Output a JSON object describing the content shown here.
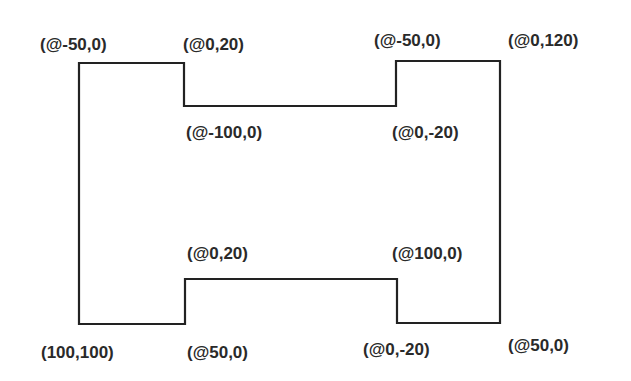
{
  "diagram": {
    "stroke_color": "#222222",
    "outline_points": [
      [
        79,
        63
      ],
      [
        184,
        63
      ],
      [
        184,
        106
      ],
      [
        396,
        106
      ],
      [
        396,
        61
      ],
      [
        500,
        61
      ],
      [
        500,
        323
      ],
      [
        397,
        323
      ],
      [
        397,
        279
      ],
      [
        185,
        279
      ],
      [
        185,
        324
      ],
      [
        79,
        324
      ]
    ],
    "labels": [
      {
        "id": "top-left-corner",
        "text": "(@-50,0)",
        "x": 40,
        "y": 36
      },
      {
        "id": "top-left-step",
        "text": "(@0,20)",
        "x": 183,
        "y": 36
      },
      {
        "id": "top-inner-left",
        "text": "(@-100,0)",
        "x": 186,
        "y": 124
      },
      {
        "id": "top-right-step",
        "text": "(@-50,0)",
        "x": 374,
        "y": 32
      },
      {
        "id": "top-right-corner",
        "text": "(@0,120)",
        "x": 508,
        "y": 32
      },
      {
        "id": "top-inner-right",
        "text": "(@0,-20)",
        "x": 392,
        "y": 124
      },
      {
        "id": "bottom-inner-left",
        "text": "(@0,20)",
        "x": 187,
        "y": 245
      },
      {
        "id": "bottom-inner-right",
        "text": "(@100,0)",
        "x": 392,
        "y": 245
      },
      {
        "id": "start-point",
        "text": "(100,100)",
        "x": 41,
        "y": 344
      },
      {
        "id": "bottom-left-step",
        "text": "(@50,0)",
        "x": 187,
        "y": 344
      },
      {
        "id": "bottom-right-step",
        "text": "(@0,-20)",
        "x": 363,
        "y": 341
      },
      {
        "id": "bottom-right-corner",
        "text": "(@50,0)",
        "x": 508,
        "y": 337
      }
    ]
  }
}
